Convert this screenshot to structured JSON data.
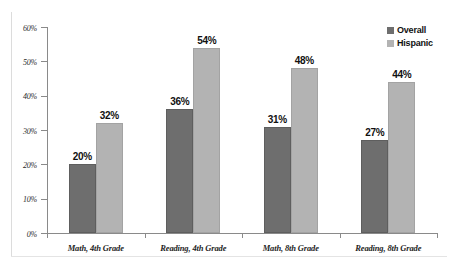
{
  "chart_data": {
    "type": "bar",
    "title": "",
    "subtitle": "",
    "xlabel": "",
    "ylabel": "",
    "ylim": [
      0,
      60
    ],
    "ytick_labels": [
      "0%",
      "10%",
      "20%",
      "30%",
      "40%",
      "50%",
      "60%"
    ],
    "ytick_values": [
      0,
      10,
      20,
      30,
      40,
      50,
      60
    ],
    "grid": false,
    "legend_position": "top-right",
    "categories": [
      "Math, 4th Grade",
      "Reading, 4th Grade",
      "Math, 8th Grade",
      "Reading, 8th Grade"
    ],
    "series": [
      {
        "name": "Overall",
        "color": "#6e6e6e",
        "values": [
          20,
          36,
          31,
          27
        ],
        "labels": [
          "20%",
          "36%",
          "31%",
          "27%"
        ]
      },
      {
        "name": "Hispanic",
        "color": "#b3b3b3",
        "values": [
          32,
          54,
          48,
          44
        ],
        "labels": [
          "32%",
          "54%",
          "48%",
          "44%"
        ]
      }
    ]
  },
  "legend": {
    "items": [
      {
        "label": "Overall",
        "color": "#6e6e6e"
      },
      {
        "label": "Hispanic",
        "color": "#b3b3b3"
      }
    ]
  }
}
